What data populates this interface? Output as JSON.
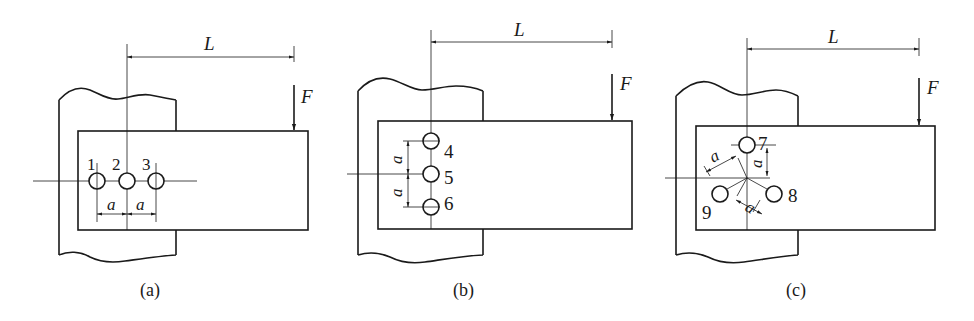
{
  "figure": {
    "panels": [
      {
        "id": "a",
        "caption": "(a)",
        "dimension_L": "L",
        "force": "F",
        "spacing": "a",
        "arrangement": "horizontal row",
        "bolts": [
          "1",
          "2",
          "3"
        ]
      },
      {
        "id": "b",
        "caption": "(b)",
        "dimension_L": "L",
        "force": "F",
        "spacing": "a",
        "arrangement": "vertical column",
        "bolts": [
          "4",
          "5",
          "6"
        ]
      },
      {
        "id": "c",
        "caption": "(c)",
        "dimension_L": "L",
        "force": "F",
        "spacing": "a",
        "arrangement": "triangular (radial, 120°)",
        "bolts": [
          "7",
          "8",
          "9"
        ]
      }
    ]
  }
}
